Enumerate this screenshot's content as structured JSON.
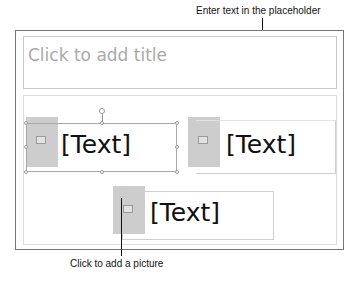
{
  "callouts": {
    "top": "Enter text in the placeholder",
    "bottom": "Click to add a picture"
  },
  "slide": {
    "title_placeholder": "Click to add title",
    "content_blocks": [
      {
        "picture_icon": "picture-icon",
        "text": "[Text]",
        "selected": true
      },
      {
        "picture_icon": "picture-icon",
        "text": "[Text]",
        "selected": false
      },
      {
        "picture_icon": "picture-icon",
        "text": "[Text]",
        "selected": false
      }
    ]
  },
  "colors": {
    "picture_placeholder": "#cdcdcd",
    "title_placeholder_text": "#a9a9a9",
    "slide_border": "#777777"
  }
}
